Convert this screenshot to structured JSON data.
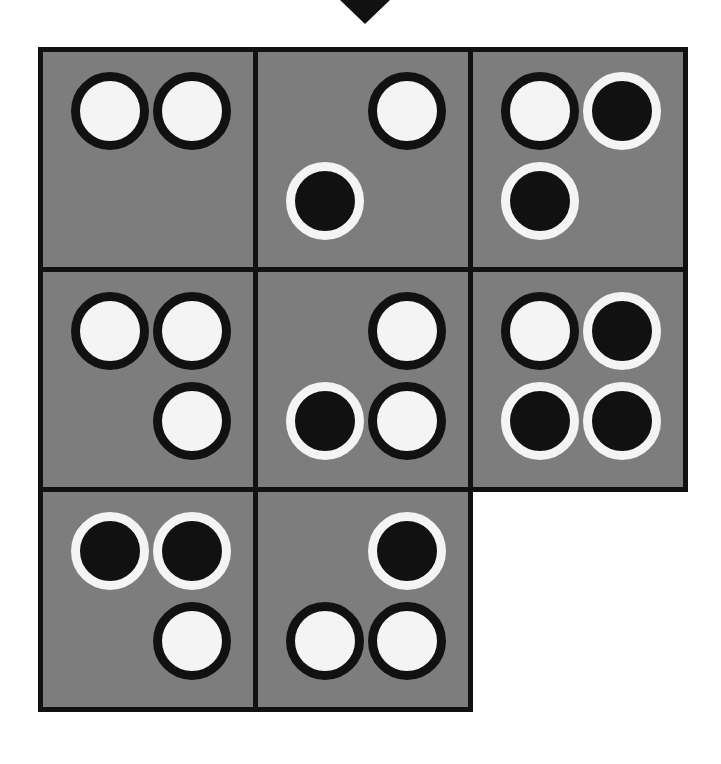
{
  "scene": {
    "title": "Abstract token grid puzzle",
    "background_color": "#ffffff",
    "cell_fill_color": "#7d7d7d",
    "cell_border_color": "#111111",
    "white_token_color": "#f4f4f4",
    "black_token_color": "#111111"
  },
  "marker": {
    "name": "column-pointer",
    "shape": "down-triangle",
    "color": "#111111",
    "left_px": 340,
    "top_px": 0,
    "width_px": 50,
    "height_px": 24
  },
  "grid": {
    "left_px": 38,
    "top_px": 47,
    "cell_width_px": 220,
    "cell_height_px": 225,
    "rows": 3,
    "columns": 3,
    "slot_size_px": 78,
    "slot_offsets": {
      "col0_x": 28,
      "col1_x": 110,
      "row0_y": 20,
      "row1_y": 110
    },
    "cells": [
      {
        "id": "r0c0",
        "present": true,
        "tokens": [
          {
            "slot": "top-left",
            "type": "white"
          },
          {
            "slot": "top-right",
            "type": "white"
          }
        ]
      },
      {
        "id": "r0c1",
        "present": true,
        "tokens": [
          {
            "slot": "top-right",
            "type": "white"
          },
          {
            "slot": "bottom-left",
            "type": "black"
          }
        ]
      },
      {
        "id": "r0c2",
        "present": true,
        "tokens": [
          {
            "slot": "top-left",
            "type": "white"
          },
          {
            "slot": "top-right",
            "type": "black"
          },
          {
            "slot": "bottom-left",
            "type": "black"
          }
        ]
      },
      {
        "id": "r1c0",
        "present": true,
        "tokens": [
          {
            "slot": "top-left",
            "type": "white"
          },
          {
            "slot": "top-right",
            "type": "white"
          },
          {
            "slot": "bottom-right",
            "type": "white"
          }
        ]
      },
      {
        "id": "r1c1",
        "present": true,
        "tokens": [
          {
            "slot": "top-right",
            "type": "white"
          },
          {
            "slot": "bottom-left",
            "type": "black"
          },
          {
            "slot": "bottom-right",
            "type": "white"
          }
        ]
      },
      {
        "id": "r1c2",
        "present": true,
        "tokens": [
          {
            "slot": "top-left",
            "type": "white"
          },
          {
            "slot": "top-right",
            "type": "black"
          },
          {
            "slot": "bottom-left",
            "type": "black"
          },
          {
            "slot": "bottom-right",
            "type": "black"
          }
        ]
      },
      {
        "id": "r2c0",
        "present": true,
        "tokens": [
          {
            "slot": "top-left",
            "type": "black"
          },
          {
            "slot": "top-right",
            "type": "black"
          },
          {
            "slot": "bottom-right",
            "type": "white"
          }
        ]
      },
      {
        "id": "r2c1",
        "present": true,
        "tokens": [
          {
            "slot": "top-right",
            "type": "black"
          },
          {
            "slot": "bottom-left",
            "type": "white"
          },
          {
            "slot": "bottom-right",
            "type": "white"
          }
        ]
      },
      {
        "id": "r2c2",
        "present": false,
        "tokens": []
      }
    ]
  }
}
